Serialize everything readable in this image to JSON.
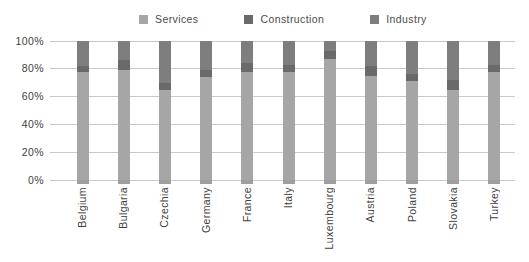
{
  "chart_data": {
    "type": "bar",
    "stacked": true,
    "orientation": "vertical",
    "title": "",
    "xlabel": "",
    "ylabel": "",
    "categories": [
      "Belgium",
      "Bulgaria",
      "Czechia",
      "Germany",
      "France",
      "Italy",
      "Luxembourg",
      "Austria",
      "Poland",
      "Slovakia",
      "Turkey"
    ],
    "series": [
      {
        "name": "Services",
        "color": "#a6a6a6",
        "values": [
          78,
          79,
          65,
          74,
          78,
          78,
          87,
          75,
          71,
          65,
          78
        ]
      },
      {
        "name": "Construction",
        "color": "#6a6a6a",
        "values": [
          4,
          7,
          5,
          5,
          6,
          5,
          6,
          7,
          5,
          7,
          5
        ]
      },
      {
        "name": "Industry",
        "color": "#7e7e7e",
        "values": [
          18,
          14,
          30,
          21,
          16,
          17,
          7,
          18,
          24,
          28,
          17
        ]
      }
    ],
    "yticks": [
      "0%",
      "20%",
      "40%",
      "60%",
      "80%",
      "100%"
    ],
    "ylim": [
      0,
      100
    ],
    "grid": "horizontal",
    "legend_position": "top",
    "colors": {
      "gridline": "#c9c9c9",
      "axis_text": "#3f3f3f",
      "legend_text": "#4a4a4a",
      "tick_mark": "#9e9e9e",
      "background": "#ffffff"
    }
  }
}
